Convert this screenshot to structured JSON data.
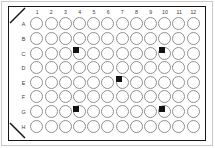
{
  "figure": {
    "name": "96-well-microplate",
    "plate_border_color": "#161616",
    "well_outline_color": "#8f8f8f",
    "marker_color": "#131313",
    "background_color": "#ffffff"
  },
  "plate": {
    "column_headers": [
      "1",
      "2",
      "3",
      "4",
      "5",
      "6",
      "7",
      "8",
      "9",
      "10",
      "11",
      "12"
    ],
    "row_headers": [
      "A",
      "B",
      "C",
      "D",
      "E",
      "F",
      "G",
      "H"
    ],
    "rows": 8,
    "columns": 12,
    "well_count": 96,
    "corner_notches": [
      "top-left",
      "bottom-left"
    ]
  },
  "markers": [
    {
      "id": "marker-1",
      "label": "B3-C4",
      "col_index": 3,
      "row_index": 2
    },
    {
      "id": "marker-2",
      "label": "B9-C10",
      "col_index": 9,
      "row_index": 2
    },
    {
      "id": "marker-3",
      "label": "D6-E7",
      "col_index": 6,
      "row_index": 4
    },
    {
      "id": "marker-4",
      "label": "F3-G4",
      "col_index": 3,
      "row_index": 6
    },
    {
      "id": "marker-5",
      "label": "F9-G10",
      "col_index": 9,
      "row_index": 6
    }
  ]
}
